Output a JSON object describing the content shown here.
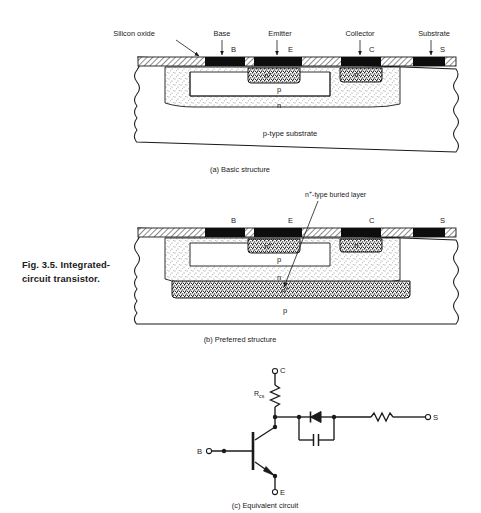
{
  "figure": {
    "caption_line1": "Fig. 3.5.  Integrated-",
    "caption_line2": "circuit transistor."
  },
  "panel_a": {
    "subcaption": "(a) Basic structure",
    "callouts": [
      {
        "name": "silicon-oxide",
        "label": "Silicon oxide"
      },
      {
        "name": "base",
        "label": "Base"
      },
      {
        "name": "emitter",
        "label": "Emitter"
      },
      {
        "name": "collector",
        "label": "Collector"
      },
      {
        "name": "substrate",
        "label": "Substrate"
      }
    ],
    "terminals": [
      {
        "name": "base-terminal",
        "label": "B"
      },
      {
        "name": "emitter-terminal",
        "label": "E"
      },
      {
        "name": "collector-terminal",
        "label": "C"
      },
      {
        "name": "substrate-terminal",
        "label": "S"
      }
    ],
    "regions": [
      {
        "name": "emitter-region",
        "label": "n",
        "sup": "+"
      },
      {
        "name": "collector-contact-region",
        "label": "n",
        "sup": "+"
      },
      {
        "name": "base-region",
        "label": "p"
      },
      {
        "name": "collector-region",
        "label": "n"
      },
      {
        "name": "substrate-region",
        "label": "p-type substrate"
      }
    ]
  },
  "panel_b": {
    "subcaption": "(b) Preferred structure",
    "annotation": {
      "name": "buried-layer-annotation",
      "label": "-type buried layer",
      "prefix": "n",
      "sup": "+"
    },
    "terminals": [
      {
        "name": "base-terminal",
        "label": "B"
      },
      {
        "name": "emitter-terminal",
        "label": "E"
      },
      {
        "name": "collector-terminal",
        "label": "C"
      },
      {
        "name": "substrate-terminal",
        "label": "S"
      }
    ],
    "regions": [
      {
        "name": "emitter-region",
        "label": "n",
        "sup": "+"
      },
      {
        "name": "collector-contact-region",
        "label": "n",
        "sup": "+"
      },
      {
        "name": "base-region",
        "label": "p"
      },
      {
        "name": "collector-region",
        "label": "n"
      },
      {
        "name": "buried-layer-region",
        "label": "n",
        "sup": "+"
      },
      {
        "name": "substrate-region",
        "label": "p"
      }
    ]
  },
  "panel_c": {
    "subcaption": "(c) Equivalent circuit",
    "components": [
      {
        "name": "collector-series-resistor",
        "label": "R",
        "sub": "cs"
      },
      {
        "name": "substrate-diode",
        "label": ""
      },
      {
        "name": "substrate-capacitor",
        "label": ""
      },
      {
        "name": "substrate-resistor",
        "label": ""
      },
      {
        "name": "npn-transistor",
        "label": ""
      }
    ],
    "terminals": [
      {
        "name": "collector-node",
        "label": "C"
      },
      {
        "name": "base-node",
        "label": "B"
      },
      {
        "name": "emitter-node",
        "label": "E"
      },
      {
        "name": "substrate-node",
        "label": "S"
      }
    ]
  },
  "colors": {
    "ink": "#1a1a1a",
    "metal": "#0d0d0d",
    "paper": "#ffffff"
  }
}
